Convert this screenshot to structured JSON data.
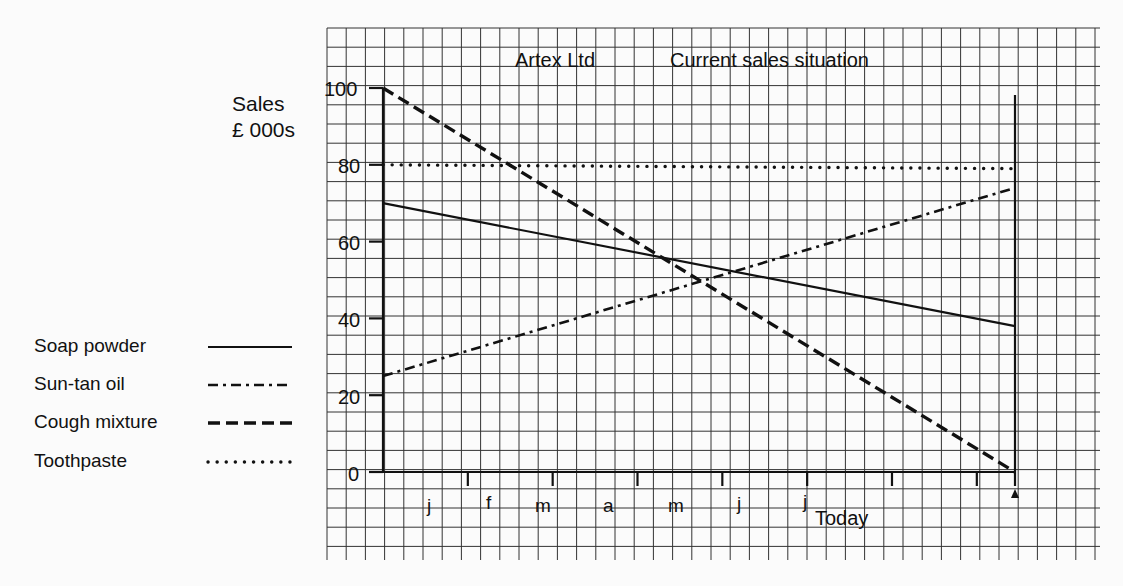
{
  "chart_data": {
    "type": "line",
    "title": "Artex Ltd",
    "subtitle": "Current sales situation",
    "ylabel": "Sales\n£ 000s",
    "ylabel_lines": [
      "Sales",
      "£ 000s"
    ],
    "xlabel": "",
    "ylim": [
      0,
      100
    ],
    "yticks": [
      0,
      20,
      40,
      60,
      80,
      100
    ],
    "x_tick_labels": [
      "j",
      "f",
      "m",
      "a",
      "m",
      "j",
      "j"
    ],
    "x_end_label": "Today",
    "grid": true,
    "legend_position": "left",
    "x": [
      "start",
      "today"
    ],
    "series": [
      {
        "name": "Soap powder",
        "style": "solid",
        "values": [
          70,
          38
        ]
      },
      {
        "name": "Sun-tan oil",
        "style": "dash-dot",
        "values": [
          25,
          74
        ]
      },
      {
        "name": "Cough mixture",
        "style": "dashed",
        "values": [
          100,
          0
        ]
      },
      {
        "name": "Toothpaste",
        "style": "dotted",
        "values": [
          80,
          79
        ]
      }
    ]
  },
  "header": {
    "company": "Artex Ltd",
    "title": "Current sales situation"
  },
  "axis": {
    "y_label_line1": "Sales",
    "y_label_line2": "£ 000s",
    "y_ticks": [
      "100",
      "80",
      "60",
      "40",
      "20",
      "0"
    ],
    "x_months": [
      "j",
      "f",
      "m",
      "a",
      "m",
      "j",
      "j"
    ],
    "today": "Today"
  },
  "legend": [
    {
      "label": "Soap powder"
    },
    {
      "label": "Sun-tan oil"
    },
    {
      "label": "Cough mixture"
    },
    {
      "label": "Toothpaste"
    }
  ]
}
